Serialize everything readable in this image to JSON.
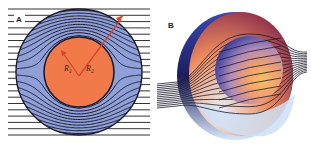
{
  "figure": {
    "panels": [
      {
        "label": "A",
        "description": "Cross-section: field lines bent around a core by a cloaking shell",
        "inner_radius_label": "R",
        "inner_radius_sub": "1",
        "outer_radius_label": "R",
        "outer_radius_sub": "2"
      },
      {
        "label": "B",
        "description": "3D view of spherical cloak with field lines flowing around the inner sphere"
      }
    ],
    "colors": {
      "shell": "#8f9fd8",
      "core": "#f27a4a",
      "lines": "#1c1c2e",
      "arrow": "#d9452a",
      "background_lines": "#333333"
    }
  }
}
